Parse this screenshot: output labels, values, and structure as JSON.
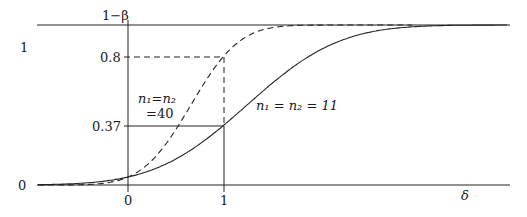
{
  "chart_data": {
    "type": "line",
    "title": "",
    "xlabel": "δ",
    "ylabel": "1−β",
    "xlim": [
      -1.0,
      4.0
    ],
    "ylim": [
      0,
      1
    ],
    "grid": false,
    "y_tick_labels": [
      "0",
      "1"
    ],
    "x_tick_labels": [
      "0",
      "1"
    ],
    "reference_levels": [
      {
        "label": "0.8",
        "value": 0.8,
        "style": "dashed",
        "x_at": 1
      },
      {
        "label": "0.37",
        "value": 0.37,
        "style": "solid",
        "x_at": 1
      }
    ],
    "series": [
      {
        "name": "n1 = n2 = 11",
        "style": "solid",
        "x": [
          -1.0,
          -0.5,
          0,
          0.25,
          0.5,
          0.75,
          1.0,
          1.5,
          2.0,
          2.5,
          3.0,
          3.5,
          4.0
        ],
        "values": [
          0.0,
          0.01,
          0.05,
          0.1,
          0.17,
          0.26,
          0.37,
          0.6,
          0.8,
          0.92,
          0.98,
          1.0,
          1.0
        ]
      },
      {
        "name": "n1 = n2 = 40",
        "style": "dashed",
        "x": [
          -1.0,
          -0.5,
          0,
          0.25,
          0.5,
          0.75,
          1.0,
          1.5,
          2.0,
          2.5,
          3.0
        ],
        "values": [
          0.0,
          0.0,
          0.05,
          0.16,
          0.35,
          0.57,
          0.8,
          0.98,
          1.0,
          1.0,
          1.0
        ]
      }
    ]
  },
  "labels": {
    "y_axis_title": "1−β",
    "y_one": "1",
    "y_zero": "0",
    "y_08": "0.8",
    "y_037": "0.37",
    "x_zero": "0",
    "x_one": "1",
    "x_axis_title": "δ",
    "series40_line1": "n₁=n₂",
    "series40_line2": "=40",
    "series11": "n₁ = n₂ = 11"
  }
}
